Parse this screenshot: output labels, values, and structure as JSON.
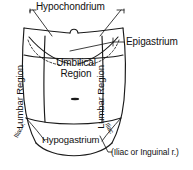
{
  "figure": {
    "ink_color": "#1a1a1a",
    "background_color": "#ffffff"
  },
  "labels": {
    "hypochondrium": "Hypochondrium",
    "epigastrium": "Epigastrium",
    "umbilical": "Umbilical Region",
    "lumbar_left": "Lumbar Region",
    "lumbar_right": "Lumbar Region",
    "hypogastrium": "Hypogastrium",
    "iliac_left": "Iliac r.",
    "iliac_right": "Iliac",
    "iliac_inguinal": "(Iliac or Inguinal r.)"
  },
  "regions": [
    {
      "id": "hypochondrium-left",
      "name": "Hypochondrium",
      "side": "left",
      "row": "upper"
    },
    {
      "id": "hypochondrium-right",
      "name": "Hypochondrium",
      "side": "right",
      "row": "upper"
    },
    {
      "id": "epigastrium",
      "name": "Epigastrium",
      "side": "center",
      "row": "upper"
    },
    {
      "id": "lumbar-left",
      "name": "Lumbar Region",
      "side": "left",
      "row": "middle"
    },
    {
      "id": "umbilical",
      "name": "Umbilical Region",
      "side": "center",
      "row": "middle"
    },
    {
      "id": "lumbar-right",
      "name": "Lumbar Region",
      "side": "right",
      "row": "middle"
    },
    {
      "id": "iliac-left",
      "name": "Iliac r.",
      "side": "left",
      "row": "lower"
    },
    {
      "id": "hypogastrium",
      "name": "Hypogastrium",
      "side": "center",
      "row": "lower"
    },
    {
      "id": "iliac-right",
      "name": "Iliac",
      "side": "right",
      "row": "lower"
    }
  ],
  "markers": {
    "umbilicus": "navel-mark",
    "xiphoid_notch": "xiphoid-notch",
    "costal_margin": "dashed-rib-margin"
  }
}
